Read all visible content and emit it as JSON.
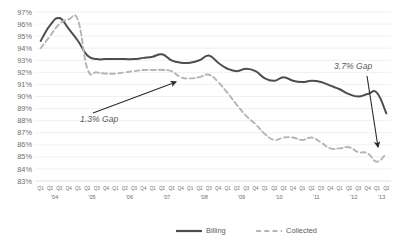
{
  "chart_data": {
    "type": "line",
    "title": "",
    "xlabel": "",
    "ylabel": "",
    "ylim": [
      83,
      97
    ],
    "ytick_labels": [
      "97%",
      "96%",
      "95%",
      "94%",
      "93%",
      "92%",
      "91%",
      "90%",
      "89%",
      "88%",
      "87%",
      "86%",
      "85%",
      "84%",
      "83%"
    ],
    "ytick_values": [
      97,
      96,
      95,
      94,
      93,
      92,
      91,
      90,
      89,
      88,
      87,
      86,
      85,
      84,
      83
    ],
    "grid": true,
    "legend_position": "bottom",
    "quarter_labels": [
      "Q1",
      "Q2",
      "Q3",
      "Q4"
    ],
    "year_labels": [
      "'04",
      "'05",
      "'06",
      "'07",
      "'08",
      "'09",
      "'10",
      "'11",
      "'12",
      "'13"
    ],
    "categories": [
      "Q1 '04",
      "Q2 '04",
      "Q3 '04",
      "Q4 '04",
      "Q1 '05",
      "Q2 '05",
      "Q3 '05",
      "Q4 '05",
      "Q1 '06",
      "Q2 '06",
      "Q3 '06",
      "Q4 '06",
      "Q1 '07",
      "Q2 '07",
      "Q3 '07",
      "Q4 '07",
      "Q1 '08",
      "Q2 '08",
      "Q3 '08",
      "Q4 '08",
      "Q1 '09",
      "Q2 '09",
      "Q3 '09",
      "Q4 '09",
      "Q1 '10",
      "Q2 '10",
      "Q3 '10",
      "Q4 '10",
      "Q1 '11",
      "Q2 '11",
      "Q3 '11",
      "Q4 '11",
      "Q1 '12",
      "Q2 '12",
      "Q3 '12",
      "Q4 '12",
      "Q1 '13",
      "Q2 '13"
    ],
    "series": [
      {
        "name": "Billing",
        "color": "#4d4d4d",
        "style": "solid",
        "values": [
          94.6,
          95.9,
          96.5,
          95.6,
          94.6,
          93.4,
          93.1,
          93.1,
          93.1,
          93.1,
          93.1,
          93.2,
          93.3,
          93.5,
          93.0,
          92.8,
          92.8,
          93.0,
          93.4,
          92.8,
          92.3,
          92.1,
          92.3,
          92.1,
          91.5,
          91.3,
          91.6,
          91.3,
          91.2,
          91.3,
          91.2,
          90.9,
          90.6,
          90.2,
          90.0,
          90.2,
          90.3,
          88.6
        ]
      },
      {
        "name": "Collected",
        "color": "#b5b5b5",
        "style": "dashed",
        "values": [
          94.0,
          95.0,
          96.0,
          96.4,
          96.3,
          92.3,
          92.0,
          91.9,
          91.9,
          92.0,
          92.1,
          92.2,
          92.2,
          92.2,
          92.1,
          91.6,
          91.5,
          91.6,
          91.8,
          91.2,
          90.3,
          89.3,
          88.4,
          87.7,
          86.9,
          86.4,
          86.6,
          86.6,
          86.4,
          86.6,
          86.2,
          85.7,
          85.7,
          85.8,
          85.4,
          85.3,
          84.6,
          85.3
        ]
      }
    ],
    "annotations": [
      {
        "name": "gap-1",
        "text": "1.3% Gap",
        "label_x": 80,
        "label_y": 122,
        "arrow_from_x": 93,
        "arrow_from_y": 113,
        "arrow_to_x": 176,
        "arrow_to_y": 82
      },
      {
        "name": "gap-2",
        "text": "3.7% Gap",
        "label_x": 334,
        "label_y": 69,
        "arrow_from_x": 367,
        "arrow_from_y": 76,
        "arrow_to_x": 378,
        "arrow_to_y": 147
      }
    ],
    "legend": [
      {
        "label": "Billing",
        "color": "#4d4d4d",
        "style": "solid"
      },
      {
        "label": "Collected",
        "color": "#b5b5b5",
        "style": "dashed"
      }
    ]
  }
}
